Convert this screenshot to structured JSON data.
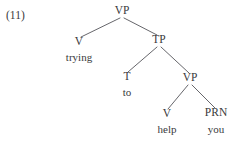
{
  "figure": {
    "example_number": "(11)",
    "background_color": "#ffffff",
    "text_color": "#3a3a3c",
    "line_color": "#55555a"
  },
  "tree": {
    "nodes": [
      {
        "id": "vp-root",
        "label": "VP",
        "x": 122,
        "y": 14,
        "kind": "category"
      },
      {
        "id": "v-trying",
        "label": "V",
        "x": 79,
        "y": 45,
        "kind": "category"
      },
      {
        "id": "tp",
        "label": "TP",
        "x": 159,
        "y": 43,
        "kind": "category"
      },
      {
        "id": "t-to",
        "label": "T",
        "x": 127,
        "y": 80,
        "kind": "category"
      },
      {
        "id": "vp-inner",
        "label": "VP",
        "x": 190,
        "y": 81,
        "kind": "category"
      },
      {
        "id": "v-help",
        "label": "V",
        "x": 167,
        "y": 117,
        "kind": "category"
      },
      {
        "id": "prn-you",
        "label": "PRN",
        "x": 216,
        "y": 116,
        "kind": "category"
      }
    ],
    "terminals": [
      {
        "id": "word-trying",
        "label": "trying",
        "x": 79,
        "y": 61,
        "parent": "v-trying"
      },
      {
        "id": "word-to",
        "label": "to",
        "x": 127,
        "y": 96,
        "parent": "t-to"
      },
      {
        "id": "word-help",
        "label": "help",
        "x": 167,
        "y": 133,
        "parent": "v-help"
      },
      {
        "id": "word-you",
        "label": "you",
        "x": 216,
        "y": 133,
        "parent": "prn-you"
      }
    ],
    "branches": [
      {
        "id": "vp-root-to-v",
        "from": "vp-root",
        "to": "v-trying",
        "x1": 120,
        "y1": 18,
        "x2": 81,
        "y2": 37
      },
      {
        "id": "vp-root-to-tp",
        "from": "vp-root",
        "to": "tp",
        "x1": 124,
        "y1": 18,
        "x2": 157,
        "y2": 35
      },
      {
        "id": "tp-to-t",
        "from": "tp",
        "to": "t-to",
        "x1": 157,
        "y1": 47,
        "x2": 128,
        "y2": 72
      },
      {
        "id": "tp-to-vp-inner",
        "from": "tp",
        "to": "vp-inner",
        "x1": 161,
        "y1": 47,
        "x2": 189,
        "y2": 73
      },
      {
        "id": "vp-inner-to-v",
        "from": "vp-inner",
        "to": "v-help",
        "x1": 188,
        "y1": 85,
        "x2": 168,
        "y2": 109
      },
      {
        "id": "vp-inner-to-prn",
        "from": "vp-inner",
        "to": "prn-you",
        "x1": 192,
        "y1": 85,
        "x2": 215,
        "y2": 108
      }
    ]
  }
}
